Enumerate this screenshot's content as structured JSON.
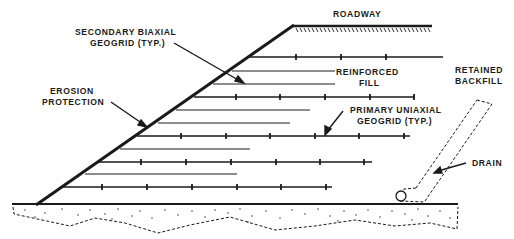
{
  "diagram": {
    "type": "reinforced-soil-slope-cross-section",
    "colors": {
      "ink": "#1a1a1a",
      "background": "#ffffff"
    },
    "labels": {
      "roadway": "ROADWAY",
      "secondary_geogrid_line1": "SECONDARY  BIAXIAL",
      "secondary_geogrid_line2": "GEOGRID  (TYP.)",
      "reinforced_fill_line1": "REINFORCED",
      "reinforced_fill_line2": "FILL",
      "retained_backfill_line1": "RETAINED",
      "retained_backfill_line2": "BACKFILL",
      "erosion_protection_line1": "EROSION",
      "erosion_protection_line2": "PROTECTION",
      "primary_geogrid_line1": "PRIMARY  UNIAXIAL",
      "primary_geogrid_line2": "GEOGRID  (TYP.)",
      "drain": "DRAIN"
    },
    "components": [
      "slope-face",
      "roadway-surface",
      "primary-uniaxial-geogrid-layers",
      "secondary-biaxial-geogrid-layers",
      "foundation-ground",
      "drain-pipe",
      "inclined-drain"
    ],
    "primary_layers": 5,
    "secondary_layers": 6
  }
}
